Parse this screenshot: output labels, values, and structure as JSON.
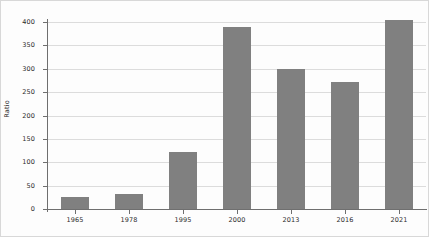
{
  "chart_data": {
    "type": "bar",
    "title": "",
    "xlabel": "",
    "ylabel": "Ratio",
    "categories": [
      "1965",
      "1978",
      "1995",
      "2000",
      "2013",
      "2016",
      "2021"
    ],
    "values": [
      26,
      33,
      122,
      389,
      300,
      272,
      405
    ],
    "series": [
      {
        "name": "Ratio",
        "values": [
          26,
          33,
          122,
          389,
          300,
          272,
          405
        ]
      }
    ],
    "ylim": [
      0,
      400
    ],
    "yticks": [
      0,
      50,
      100,
      150,
      200,
      250,
      300,
      350,
      400
    ],
    "ytick_labels": [
      "0",
      "50",
      "100",
      "150",
      "200",
      "250",
      "300",
      "350",
      "400"
    ],
    "grid": true,
    "legend": false,
    "legend_position": "none",
    "bar_color": "#808080",
    "gridline_color": "#dcdcdc",
    "axis_color": "#6f6f6f",
    "background_color": "#fdfdfd",
    "text_color": "#2b2b2b"
  }
}
